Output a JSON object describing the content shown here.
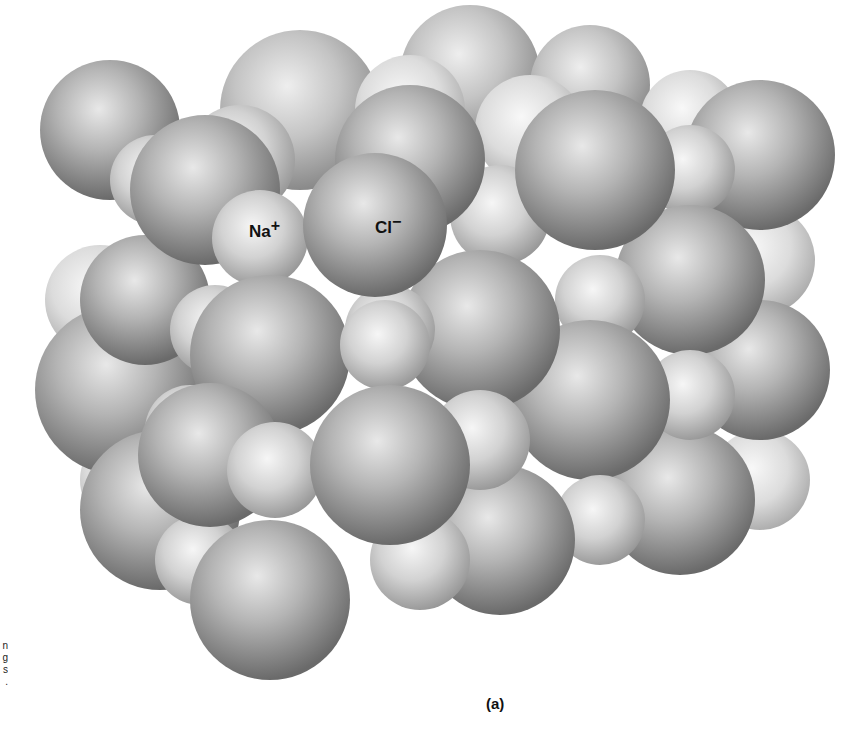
{
  "figure": {
    "panel_label": "(a)",
    "ion_labels": [
      {
        "id": "sodium",
        "text": "Na",
        "charge": "+"
      },
      {
        "id": "chloride",
        "text": "Cl",
        "charge": "−"
      }
    ],
    "left_margin_fragments": [
      "n",
      "g",
      "s",
      "."
    ],
    "colors": {
      "background": "#ffffff",
      "large_sphere_highlight": "#e6e6e6",
      "large_sphere_shadow": "#6e6e6e",
      "small_sphere_highlight": "#f4f4f4",
      "small_sphere_shadow": "#9a9a9a",
      "text": "#111111"
    }
  }
}
